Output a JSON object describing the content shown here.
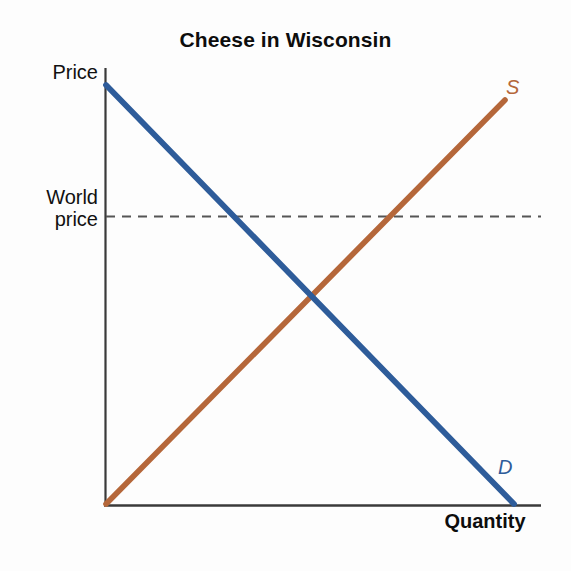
{
  "chart_data": {
    "type": "line",
    "title": "Cheese in Wisconsin",
    "xlabel": "Quantity",
    "ylabel": "Price",
    "grid": false,
    "legend_position": "inline-curve-end",
    "axes": {
      "x_axis": {
        "label": "Quantity",
        "ticks": [],
        "range_note": "unlabeled quantity axis"
      },
      "y_axis": {
        "label": "Price",
        "ticks": [
          "World price"
        ],
        "range_note": "unlabeled price axis"
      }
    },
    "series": [
      {
        "name": "Demand",
        "label": "D",
        "color": "#2e5c9a",
        "type": "line",
        "slope": "downward",
        "points": [
          {
            "x": 0,
            "y": 103
          },
          {
            "x": 100,
            "y": 0
          }
        ]
      },
      {
        "name": "Supply",
        "label": "S",
        "color": "#b5673a",
        "type": "line",
        "slope": "upward",
        "points": [
          {
            "x": 0,
            "y": 0
          },
          {
            "x": 98,
            "y": 93
          }
        ]
      }
    ],
    "annotations": [
      {
        "name": "world-price-line",
        "label": "World price",
        "type": "horizontal-dashed-line",
        "color": "#555555",
        "y": 66,
        "note": "dashed horizontal line above the domestic equilibrium price"
      },
      {
        "name": "equilibrium-point",
        "type": "intersection",
        "x": 46,
        "y": 48,
        "note": "intersection of supply and demand (domestic equilibrium)"
      }
    ]
  },
  "chart": {
    "title": "Cheese in Wisconsin",
    "y_axis_label": "Price",
    "world_price_label": "World price",
    "x_axis_label": "Quantity",
    "supply_label": "S",
    "demand_label": "D",
    "colors": {
      "supply": "#b5673a",
      "demand": "#2e5c9a",
      "axis": "#3a3a3a",
      "dashed": "#555555",
      "text": "#111111",
      "background": "#fdfdfd"
    }
  }
}
